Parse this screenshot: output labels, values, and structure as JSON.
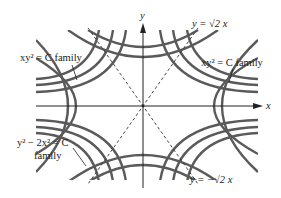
{
  "figure": {
    "colors": {
      "curve": "#5a5a5a",
      "axis": "#222222",
      "dashed": "#333333",
      "text": "#222222",
      "background": "#ffffff"
    },
    "axes": {
      "x_label": "x",
      "y_label": "y"
    },
    "labels": {
      "top_right_line": "y = √2 x",
      "bottom_right_line": "y = −√2 x",
      "upper_left_family": "xy² = C family",
      "upper_right_family": "xy² = C family",
      "lower_left_family_line1": "y² − 2x² = C",
      "lower_left_family_line2": "family"
    }
  }
}
